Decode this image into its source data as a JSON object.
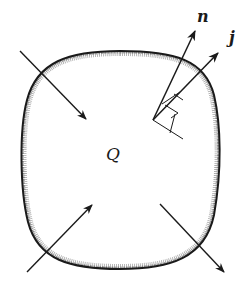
{
  "diagram": {
    "region_label": "Q",
    "vectors": [
      {
        "name": "normal",
        "label": "n"
      },
      {
        "name": "flux",
        "label": "j"
      }
    ],
    "arrows": [
      {
        "name": "inflow-top-left",
        "direction": "in"
      },
      {
        "name": "inflow-bottom-left",
        "direction": "in"
      },
      {
        "name": "outflow-bottom-right",
        "direction": "out"
      }
    ],
    "colors": {
      "stroke": "#1a1a1a",
      "shading": "#6e6e6e",
      "background": "#ffffff"
    }
  }
}
